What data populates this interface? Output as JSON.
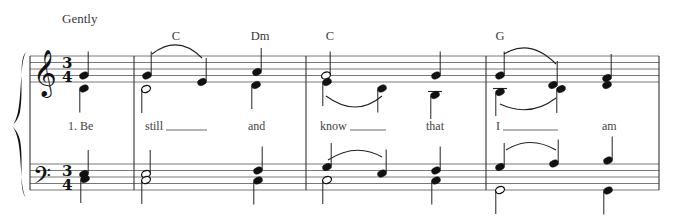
{
  "score": {
    "tempo_marking": "Gently",
    "time_signature": {
      "numerator": "3",
      "denominator": "4"
    },
    "clefs": {
      "treble": "𝄞",
      "bass": "𝄢"
    },
    "chords": [
      {
        "label": "C",
        "x": 176
      },
      {
        "label": "Dm",
        "x": 260
      },
      {
        "label": "C",
        "x": 330
      },
      {
        "label": "G",
        "x": 500
      }
    ],
    "lyrics": [
      {
        "text": "1. Be",
        "x": 68,
        "extender": null
      },
      {
        "text": "still",
        "x": 145,
        "extender": [
          166,
          207
        ]
      },
      {
        "text": "and",
        "x": 248,
        "extender": null
      },
      {
        "text": "know",
        "x": 320,
        "extender": [
          350,
          386
        ]
      },
      {
        "text": "that",
        "x": 426,
        "extender": null
      },
      {
        "text": "I",
        "x": 496,
        "extender": [
          503,
          558
        ]
      },
      {
        "text": "am",
        "x": 602,
        "extender": null
      }
    ],
    "layout": {
      "treble_lines": [
        56,
        62.5,
        69,
        75.5,
        82
      ],
      "bass_lines": [
        164,
        170.5,
        177,
        183.5,
        190
      ],
      "system_left": 30,
      "system_right": 659,
      "barlines": [
        134,
        306,
        486,
        659
      ],
      "lyric_y": 130,
      "ink_color": "#222222",
      "staff_color": "#6a6a6a"
    },
    "notes": [
      {
        "x": 84,
        "y": 75.5,
        "filled": true,
        "stem": "up"
      },
      {
        "x": 84,
        "y": 88.5,
        "filled": true,
        "stem": "down"
      },
      {
        "x": 147,
        "y": 75.5,
        "filled": true,
        "stem": "up"
      },
      {
        "x": 146,
        "y": 89,
        "filled": false,
        "stem": "down"
      },
      {
        "x": 202,
        "y": 82,
        "filled": true,
        "stem": "up"
      },
      {
        "x": 257,
        "y": 72,
        "filled": true,
        "stem": "up"
      },
      {
        "x": 256,
        "y": 85,
        "filled": true,
        "stem": "down"
      },
      {
        "x": 326,
        "y": 75.5,
        "filled": false,
        "stem": "up"
      },
      {
        "x": 327,
        "y": 82,
        "filled": true,
        "stem": "down"
      },
      {
        "x": 382,
        "y": 88.5,
        "filled": true,
        "stem": "down"
      },
      {
        "x": 436,
        "y": 75.5,
        "filled": true,
        "stem": "up"
      },
      {
        "x": 435,
        "y": 95,
        "filled": true,
        "stem": "down",
        "ledger": true
      },
      {
        "x": 500,
        "y": 75.5,
        "filled": true,
        "stem": "up"
      },
      {
        "x": 500,
        "y": 92,
        "filled": true,
        "stem": "down",
        "ledger": true
      },
      {
        "x": 553,
        "y": 85,
        "filled": true,
        "stem": "up"
      },
      {
        "x": 561,
        "y": 89,
        "filled": true,
        "stem": "down"
      },
      {
        "x": 607,
        "y": 78,
        "filled": true,
        "stem": "up"
      },
      {
        "x": 607,
        "y": 85,
        "filled": true,
        "stem": "none"
      },
      {
        "x": 84,
        "y": 174,
        "filled": true,
        "stem": "up"
      },
      {
        "x": 85,
        "y": 179,
        "filled": true,
        "stem": "down"
      },
      {
        "x": 146,
        "y": 174,
        "filled": false,
        "stem": "up"
      },
      {
        "x": 146,
        "y": 180,
        "filled": false,
        "stem": "down"
      },
      {
        "x": 258,
        "y": 170.5,
        "filled": true,
        "stem": "up"
      },
      {
        "x": 258,
        "y": 180.5,
        "filled": true,
        "stem": "down"
      },
      {
        "x": 327,
        "y": 167,
        "filled": true,
        "stem": "up"
      },
      {
        "x": 327,
        "y": 180,
        "filled": false,
        "stem": "down"
      },
      {
        "x": 382,
        "y": 173.5,
        "filled": true,
        "stem": "up"
      },
      {
        "x": 436,
        "y": 170.5,
        "filled": true,
        "stem": "up"
      },
      {
        "x": 436,
        "y": 180.5,
        "filled": true,
        "stem": "down"
      },
      {
        "x": 500,
        "y": 167,
        "filled": true,
        "stem": "up"
      },
      {
        "x": 500,
        "y": 190,
        "filled": false,
        "stem": "down"
      },
      {
        "x": 554,
        "y": 163.5,
        "filled": true,
        "stem": "up"
      },
      {
        "x": 608,
        "y": 160.5,
        "filled": true,
        "stem": "up"
      },
      {
        "x": 608,
        "y": 190.5,
        "filled": true,
        "stem": "down"
      }
    ],
    "slurs": [
      {
        "d": "M152,54 Q178,34 202,58"
      },
      {
        "d": "M326,96 Q356,118 382,96"
      },
      {
        "d": "M504,54 Q530,38 556,64"
      },
      {
        "d": "M500,104 Q530,118 556,98"
      },
      {
        "d": "M328,160 Q356,142 382,157"
      },
      {
        "d": "M506,150 Q530,135 556,150"
      }
    ]
  }
}
